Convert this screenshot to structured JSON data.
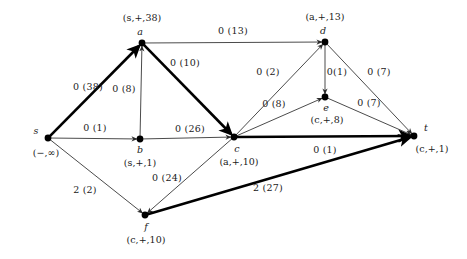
{
  "figure": {
    "type": "flow-network-diagram",
    "width": 467,
    "height": 259,
    "background": "#ffffff",
    "line_color": "#2b2b2b",
    "thick_edge_color": "#000000",
    "node_color": "#000000"
  },
  "nodes": [
    {
      "id": "s",
      "name": "s",
      "label": "(−,∞)",
      "x": 48,
      "y": 138,
      "name_dx": -12,
      "name_dy": -7,
      "label_dx": -2,
      "label_dy": 15
    },
    {
      "id": "a",
      "name": "a",
      "label": "(s,+,38)",
      "x": 142,
      "y": 43,
      "name_dx": -2,
      "name_dy": -11,
      "label_dx": 0,
      "label_dy": -25
    },
    {
      "id": "b",
      "name": "b",
      "label": "(s,+,1)",
      "x": 140,
      "y": 139,
      "name_dx": 0,
      "name_dy": 11,
      "label_dx": 0,
      "label_dy": 24
    },
    {
      "id": "c",
      "name": "c",
      "label": "(a,+,10)",
      "x": 234,
      "y": 137,
      "name_dx": 3,
      "name_dy": 12,
      "label_dx": 5,
      "label_dy": 25
    },
    {
      "id": "d",
      "name": "d",
      "label": "(a,+,13)",
      "x": 325,
      "y": 42,
      "name_dx": -2,
      "name_dy": -11,
      "label_dx": 0,
      "label_dy": -25
    },
    {
      "id": "e",
      "name": "e",
      "label": "(c,+,8)",
      "x": 325,
      "y": 97,
      "name_dx": 1,
      "name_dy": 11,
      "label_dx": 2,
      "label_dy": 23
    },
    {
      "id": "f",
      "name": "f",
      "label": "(c,+,10)",
      "x": 145,
      "y": 215,
      "name_dx": 1,
      "name_dy": 12,
      "label_dx": 1,
      "label_dy": 25
    },
    {
      "id": "t",
      "name": "t",
      "label": "(c,+,1)",
      "x": 414,
      "y": 136,
      "name_dx": 12,
      "name_dy": -8,
      "label_dx": 18,
      "label_dy": 13
    }
  ],
  "edges": [
    {
      "id": "s-a",
      "from": "s",
      "to": "a",
      "label": "0 (38)",
      "thick": true,
      "lx": 88,
      "ly": 87
    },
    {
      "id": "s-b",
      "from": "s",
      "to": "b",
      "label": "0 (1)",
      "thick": false,
      "lx": 95,
      "ly": 128
    },
    {
      "id": "s-f",
      "from": "s",
      "to": "f",
      "label": "2 (2)",
      "thick": false,
      "lx": 85,
      "ly": 190
    },
    {
      "id": "b-a",
      "from": "b",
      "to": "a",
      "label": "0 (8)",
      "thick": false,
      "lx": 124,
      "ly": 89
    },
    {
      "id": "a-d",
      "from": "a",
      "to": "d",
      "label": "0 (13)",
      "thick": false,
      "lx": 233,
      "ly": 31
    },
    {
      "id": "a-c",
      "from": "a",
      "to": "c",
      "label": "0 (10)",
      "thick": true,
      "lx": 185,
      "ly": 63
    },
    {
      "id": "b-c",
      "from": "b",
      "to": "c",
      "label": "0 (26)",
      "thick": false,
      "lx": 190,
      "ly": 129
    },
    {
      "id": "c-d",
      "from": "c",
      "to": "d",
      "label": "0 (2)",
      "thick": false,
      "lx": 268,
      "ly": 72
    },
    {
      "id": "c-e",
      "from": "c",
      "to": "e",
      "label": "0 (8)",
      "thick": false,
      "lx": 274,
      "ly": 104
    },
    {
      "id": "d-e",
      "from": "d",
      "to": "e",
      "label": "0(1)",
      "thick": false,
      "lx": 337,
      "ly": 72
    },
    {
      "id": "d-t",
      "from": "d",
      "to": "t",
      "label": "0 (7)",
      "thick": false,
      "lx": 379,
      "ly": 72
    },
    {
      "id": "e-t",
      "from": "e",
      "to": "t",
      "label": "0 (7)",
      "thick": false,
      "lx": 369,
      "ly": 103
    },
    {
      "id": "c-t",
      "from": "c",
      "to": "t",
      "label": "0 (1)",
      "thick": true,
      "lx": 325,
      "ly": 150
    },
    {
      "id": "c-f",
      "from": "c",
      "to": "f",
      "label": "0 (24)",
      "thick": false,
      "lx": 167,
      "ly": 178
    },
    {
      "id": "f-t",
      "from": "f",
      "to": "t",
      "label": "2 (27)",
      "thick": true,
      "lx": 268,
      "ly": 188
    }
  ]
}
